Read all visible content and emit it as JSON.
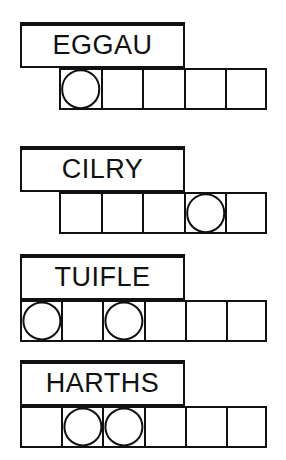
{
  "page": {
    "background_color": "#ffffff",
    "ink_color": "#111111",
    "width": 286,
    "height": 460
  },
  "puzzle": {
    "description": "Four word-and-answer-grid rows; each word sits in a banner box above a strip of empty square cells, some cells marked with a circle.",
    "groups": [
      {
        "id": "group-eggau",
        "word": "EGGAU",
        "word_box": {
          "x": 20,
          "y": 22,
          "width": 165,
          "height": 46
        },
        "cell_row": {
          "x": 59,
          "y": 68,
          "cell_width": 41.6,
          "cell_height": 42,
          "count": 5
        },
        "cells": [
          {
            "index": 0,
            "circled": true
          },
          {
            "index": 1,
            "circled": false
          },
          {
            "index": 2,
            "circled": false
          },
          {
            "index": 3,
            "circled": false
          },
          {
            "index": 4,
            "circled": false
          }
        ]
      },
      {
        "id": "group-cilry",
        "word": "CILRY",
        "word_box": {
          "x": 20,
          "y": 146,
          "width": 165,
          "height": 46
        },
        "cell_row": {
          "x": 59,
          "y": 192,
          "cell_width": 41.6,
          "cell_height": 42,
          "count": 5
        },
        "cells": [
          {
            "index": 0,
            "circled": false
          },
          {
            "index": 1,
            "circled": false
          },
          {
            "index": 2,
            "circled": false
          },
          {
            "index": 3,
            "circled": true
          },
          {
            "index": 4,
            "circled": false
          }
        ]
      },
      {
        "id": "group-tuifle",
        "word": "TUIFLE",
        "word_box": {
          "x": 20,
          "y": 254,
          "width": 165,
          "height": 46
        },
        "cell_row": {
          "x": 20,
          "y": 300,
          "cell_width": 41.2,
          "cell_height": 42,
          "count": 6
        },
        "cells": [
          {
            "index": 0,
            "circled": true
          },
          {
            "index": 1,
            "circled": false
          },
          {
            "index": 2,
            "circled": true
          },
          {
            "index": 3,
            "circled": false
          },
          {
            "index": 4,
            "circled": false
          },
          {
            "index": 5,
            "circled": false
          }
        ]
      },
      {
        "id": "group-harths",
        "word": "HARTHS",
        "word_box": {
          "x": 20,
          "y": 360,
          "width": 165,
          "height": 46
        },
        "cell_row": {
          "x": 20,
          "y": 406,
          "cell_width": 41.2,
          "cell_height": 42,
          "count": 6
        },
        "cells": [
          {
            "index": 0,
            "circled": false
          },
          {
            "index": 1,
            "circled": true
          },
          {
            "index": 2,
            "circled": true
          },
          {
            "index": 3,
            "circled": false
          },
          {
            "index": 4,
            "circled": false
          },
          {
            "index": 5,
            "circled": false
          }
        ]
      }
    ]
  }
}
